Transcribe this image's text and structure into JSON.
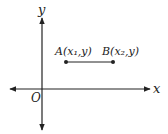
{
  "diagram": {
    "type": "coordinate-plane",
    "axes": {
      "x_label": "x",
      "y_label": "y",
      "origin_label": "O"
    },
    "points": [
      {
        "name": "A",
        "label": "A(x₁,y)"
      },
      {
        "name": "B",
        "label": "B(x₂,y)"
      }
    ],
    "segment": {
      "from": "A",
      "to": "B",
      "description": "horizontal segment"
    },
    "colors": {
      "stroke": "#222222"
    }
  }
}
